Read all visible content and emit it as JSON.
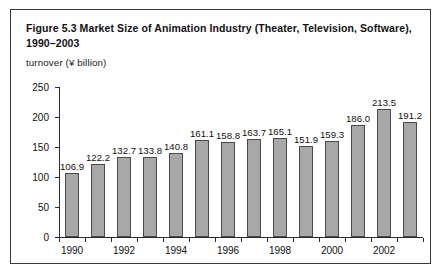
{
  "figure": {
    "title": "Figure 5.3  Market Size of Animation Industry (Theater, Television, Software), 1990–2003",
    "unit_label": "turnover (¥ billion)"
  },
  "colors": {
    "bar_fill": "#a8a8a8",
    "bar_border": "#4a4a4a",
    "axis": "#2b2b2b",
    "frame": "#3a3a3a",
    "text": "#111111",
    "background": "#ffffff"
  },
  "chart_data": {
    "type": "bar",
    "title": "Figure 5.3  Market Size of Animation Industry (Theater, Television, Software), 1990–2003",
    "subtitle": "turnover (¥ billion)",
    "xlabel": "",
    "ylabel": "turnover (¥ billion)",
    "categories": [
      "1990",
      "1991",
      "1992",
      "1993",
      "1994",
      "1995",
      "1996",
      "1997",
      "1998",
      "1999",
      "2000",
      "2001",
      "2002",
      "2003"
    ],
    "values": [
      106.9,
      122.2,
      132.7,
      133.8,
      140.8,
      161.1,
      158.8,
      163.7,
      165.1,
      151.9,
      159.3,
      186.0,
      213.5,
      191.2
    ],
    "value_labels": [
      "106.9",
      "122.2",
      "132.7",
      "133.8",
      "140.8",
      "161.1",
      "158.8",
      "163.7",
      "165.1",
      "151.9",
      "159.3",
      "186.0",
      "213.5",
      "191.2"
    ],
    "ylim": [
      0,
      250
    ],
    "yticks": [
      0,
      50,
      100,
      150,
      200,
      250
    ],
    "ytick_labels": [
      "0",
      "50",
      "100",
      "150",
      "200",
      "250"
    ],
    "xtick_labels": [
      "1990",
      "1992",
      "1994",
      "1996",
      "1998",
      "2000",
      "2002"
    ],
    "xtick_label_indices": [
      0,
      2,
      4,
      6,
      8,
      10,
      12
    ],
    "grid": false,
    "legend": null,
    "legend_position": "none"
  }
}
